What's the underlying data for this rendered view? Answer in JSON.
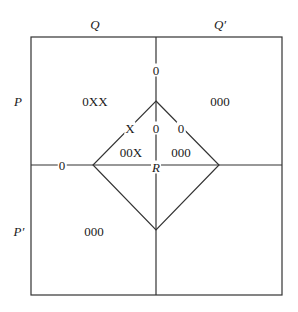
{
  "diagram": {
    "column_labels": {
      "left": "Q",
      "right": "Q′"
    },
    "row_labels": {
      "top": "P",
      "bottom": "P′"
    },
    "center_label": "R",
    "regions": {
      "top_left": "0XX",
      "top_right": "000",
      "bottom_left": "000",
      "diamond_upper_left": "00X",
      "diamond_upper_right": "000"
    },
    "edge_marks": {
      "top_vertical": "0",
      "diamond_center_vertical": "0",
      "diamond_upper_left_edge": "X",
      "diamond_upper_right_edge": "0",
      "left_horizontal": "0"
    },
    "colors": {
      "line": "#333333",
      "text": "#1a1a1a"
    }
  }
}
